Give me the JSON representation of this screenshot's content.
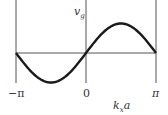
{
  "chart_data": {
    "type": "line",
    "title": "",
    "xlabel": "k_x a",
    "ylabel": "v_g",
    "x_ticks": [
      "-π",
      "0",
      "π"
    ],
    "xlim": [
      -3.14159,
      3.14159
    ],
    "grid": false,
    "legend": null,
    "series": [
      {
        "name": "v_g",
        "function": "sin(k_x a)",
        "x": [
          -3.14,
          -2.36,
          -1.57,
          -0.79,
          0,
          0.79,
          1.57,
          2.36,
          3.14
        ],
        "y": [
          0,
          -0.71,
          -1,
          -0.71,
          0,
          0.71,
          1,
          0.71,
          0
        ]
      }
    ]
  },
  "labels": {
    "ylabel_main": "v",
    "ylabel_sub": "g",
    "xlabel_main": "k",
    "xlabel_sub": "x",
    "xlabel_tail": "a",
    "tick_left": "−π",
    "tick_mid": "0",
    "tick_right": "π"
  },
  "colors": {
    "curve": "#1a1a1a",
    "axes": "#555555"
  }
}
